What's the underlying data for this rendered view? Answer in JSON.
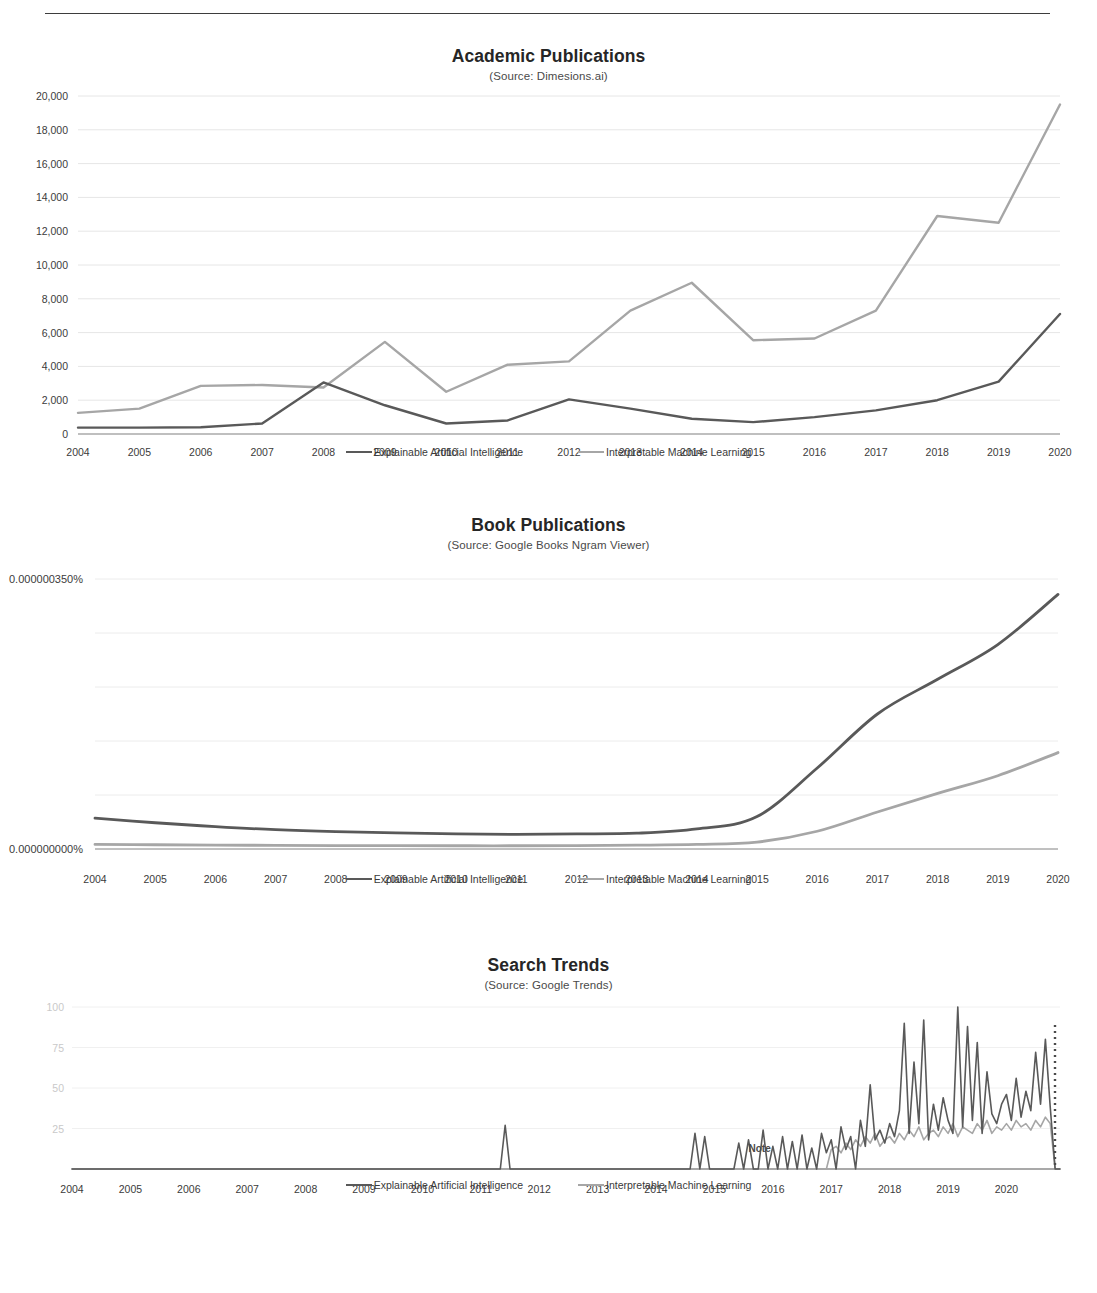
{
  "header": {
    "running_text": "",
    "rule": "horizontal-rule"
  },
  "series_names": {
    "xai": "Explainable Artificial Intelligence",
    "iml": "Interpretable Machine Learning"
  },
  "colors": {
    "xai": "#595959",
    "iml": "#a6a6a6",
    "grid": "#e6e6e6",
    "axis": "#8c8c8c",
    "text": "#3b3b3b",
    "faint_text": "#c9c9c9"
  },
  "charts": [
    {
      "id": "academic-publications",
      "title": "Academic Publications",
      "subtitle": "(Source: Dimesions.ai)",
      "legend": {
        "xai": "Explainable Artificial Intelligence",
        "iml": "Interpretable Machine Learning"
      }
    },
    {
      "id": "book-publications",
      "title": "Book Publications",
      "subtitle": "(Source: Google Books  Ngram Viewer)",
      "legend": {
        "xai": "Explainable Artificial Intelligence",
        "iml": "Interpretable Machine Learning"
      }
    },
    {
      "id": "search-trends",
      "title": "Search Trends",
      "subtitle": "(Source: Google Trends)",
      "annotation": "Note",
      "legend": {
        "xai": "Explainable Artificial Intelligence",
        "iml": "Interpretable Machine Learning"
      }
    }
  ],
  "chart_data": [
    {
      "type": "line",
      "id": "academic-publications",
      "title": "Academic Publications",
      "subtitle": "(Source: Dimesions.ai)",
      "xlabel": "",
      "ylabel": "",
      "grid": true,
      "legend_position": "bottom",
      "ylim": [
        0,
        20000
      ],
      "yticks": [
        0,
        2000,
        4000,
        6000,
        8000,
        10000,
        12000,
        14000,
        16000,
        18000,
        20000
      ],
      "ytick_labels": [
        "0",
        "2,000",
        "4,000",
        "6,000",
        "8,000",
        "10,000",
        "12,000",
        "14,000",
        "16,000",
        "18,000",
        "20,000"
      ],
      "categories": [
        2004,
        2005,
        2006,
        2007,
        2008,
        2009,
        2010,
        2011,
        2012,
        2013,
        2014,
        2015,
        2016,
        2017,
        2018,
        2019,
        2020
      ],
      "xtick_labels": [
        "2004",
        "2005",
        "2006",
        "2007",
        "2008",
        "2009",
        "2010",
        "2011",
        "2012",
        "2013",
        "2014",
        "2015",
        "2016",
        "2017",
        "2018",
        "2019",
        "2020"
      ],
      "series": [
        {
          "name": "Explainable Artificial Intelligence",
          "color": "#595959",
          "values": [
            380,
            380,
            400,
            620,
            3050,
            1700,
            620,
            800,
            2050,
            1500,
            900,
            700,
            1000,
            1400,
            2000,
            3100,
            7100
          ]
        },
        {
          "name": "Interpretable Machine Learning",
          "color": "#a6a6a6",
          "values": [
            1250,
            1500,
            2850,
            2900,
            2750,
            5450,
            2500,
            4100,
            4300,
            7300,
            8950,
            5550,
            5650,
            7300,
            12900,
            12500,
            19500
          ]
        }
      ]
    },
    {
      "type": "line",
      "id": "book-publications",
      "title": "Book Publications",
      "subtitle": "(Source: Google Books  Ngram Viewer)",
      "xlabel": "",
      "ylabel": "",
      "grid": true,
      "legend_position": "bottom",
      "ylim": [
        0,
        3.5e-07
      ],
      "yticks": [
        0,
        3.5e-07
      ],
      "ytick_labels": [
        "0.000000000%",
        "0.000000350%"
      ],
      "categories": [
        2004,
        2005,
        2006,
        2007,
        2008,
        2009,
        2010,
        2011,
        2012,
        2013,
        2014,
        2015,
        2016,
        2017,
        2018,
        2019,
        2020
      ],
      "xtick_labels": [
        "2004",
        "2005",
        "2006",
        "2007",
        "2008",
        "2009",
        "2010",
        "2011",
        "2012",
        "2013",
        "2014",
        "2015",
        "2016",
        "2017",
        "2018",
        "2019",
        "2020"
      ],
      "series": [
        {
          "name": "Explainable Artificial Intelligence",
          "color": "#595959",
          "values": [
            4e-08,
            3.4e-08,
            2.9e-08,
            2.5e-08,
            2.25e-08,
            2.1e-08,
            1.95e-08,
            1.9e-08,
            1.95e-08,
            2.05e-08,
            2.6e-08,
            4.2e-08,
            1.05e-07,
            1.75e-07,
            2.2e-07,
            2.65e-07,
            3.3e-07
          ]
        },
        {
          "name": "Interpretable Machine Learning",
          "color": "#a6a6a6",
          "values": [
            6e-09,
            5.5e-09,
            5e-09,
            4.8e-09,
            4.5e-09,
            4.3e-09,
            4.2e-09,
            4.2e-09,
            4.5e-09,
            5e-09,
            6e-09,
            9e-09,
            2.3e-08,
            4.8e-08,
            7.2e-08,
            9.5e-08,
            1.25e-07
          ]
        }
      ]
    },
    {
      "type": "line",
      "id": "search-trends",
      "title": "Search Trends",
      "subtitle": "(Source: Google Trends)",
      "xlabel": "",
      "ylabel": "",
      "grid": true,
      "legend_position": "bottom",
      "annotation": "Note",
      "ylim": [
        0,
        100
      ],
      "yticks": [
        25,
        50,
        75,
        100
      ],
      "ytick_labels": [
        "25",
        "50",
        "75",
        "100"
      ],
      "xtick_labels": [
        "2004",
        "2005",
        "2006",
        "2007",
        "2008",
        "2009",
        "2010",
        "2011",
        "2012",
        "2013",
        "2014",
        "2015",
        "2016",
        "2017",
        "2018",
        "2019",
        "2020"
      ],
      "x_start": 2004,
      "x_end": 2020.75,
      "sampling": "monthly",
      "series": [
        {
          "name": "Explainable Artificial Intelligence",
          "color": "#595959",
          "values": [
            0,
            0,
            0,
            0,
            0,
            0,
            0,
            0,
            0,
            0,
            0,
            0,
            0,
            0,
            0,
            0,
            0,
            0,
            0,
            0,
            0,
            0,
            0,
            0,
            0,
            0,
            0,
            0,
            0,
            0,
            0,
            0,
            0,
            0,
            0,
            0,
            0,
            0,
            0,
            0,
            0,
            0,
            0,
            0,
            0,
            0,
            0,
            0,
            0,
            0,
            0,
            0,
            0,
            0,
            0,
            0,
            0,
            0,
            0,
            0,
            0,
            0,
            0,
            0,
            0,
            0,
            0,
            0,
            0,
            0,
            0,
            0,
            0,
            0,
            0,
            0,
            0,
            0,
            0,
            0,
            0,
            0,
            0,
            0,
            0,
            0,
            0,
            0,
            0,
            27,
            0,
            0,
            0,
            0,
            0,
            0,
            0,
            0,
            0,
            0,
            0,
            0,
            0,
            0,
            0,
            0,
            0,
            0,
            0,
            0,
            0,
            0,
            0,
            0,
            0,
            0,
            0,
            0,
            0,
            0,
            0,
            0,
            0,
            0,
            0,
            0,
            0,
            0,
            22,
            0,
            20,
            0,
            0,
            0,
            0,
            0,
            0,
            16,
            0,
            18,
            0,
            0,
            24,
            0,
            14,
            0,
            20,
            0,
            17,
            0,
            21,
            0,
            13,
            0,
            22,
            10,
            18,
            0,
            26,
            12,
            20,
            0,
            30,
            14,
            52,
            18,
            24,
            16,
            28,
            20,
            36,
            90,
            22,
            66,
            28,
            92,
            18,
            40,
            24,
            44,
            30,
            22,
            100,
            26,
            88,
            30,
            78,
            22,
            60,
            34,
            28,
            40,
            46,
            30,
            56,
            32,
            48,
            36,
            72,
            40,
            80,
            38,
            0,
            0
          ]
        },
        {
          "name": "Interpretable Machine Learning",
          "color": "#a6a6a6",
          "values": [
            0,
            0,
            0,
            0,
            0,
            0,
            0,
            0,
            0,
            0,
            0,
            0,
            0,
            0,
            0,
            0,
            0,
            0,
            0,
            0,
            0,
            0,
            0,
            0,
            0,
            0,
            0,
            0,
            0,
            0,
            0,
            0,
            0,
            0,
            0,
            0,
            0,
            0,
            0,
            0,
            0,
            0,
            0,
            0,
            0,
            0,
            0,
            0,
            0,
            0,
            0,
            0,
            0,
            0,
            0,
            0,
            0,
            0,
            0,
            0,
            0,
            0,
            0,
            0,
            0,
            0,
            0,
            0,
            0,
            0,
            0,
            0,
            0,
            0,
            0,
            0,
            0,
            0,
            0,
            0,
            0,
            0,
            0,
            0,
            0,
            0,
            0,
            0,
            0,
            0,
            0,
            0,
            0,
            0,
            0,
            0,
            0,
            0,
            0,
            0,
            0,
            0,
            0,
            0,
            0,
            0,
            0,
            0,
            0,
            0,
            0,
            0,
            0,
            0,
            0,
            0,
            0,
            0,
            0,
            0,
            0,
            0,
            0,
            0,
            0,
            0,
            0,
            0,
            0,
            0,
            0,
            0,
            0,
            0,
            0,
            0,
            0,
            0,
            0,
            0,
            0,
            0,
            0,
            0,
            0,
            0,
            0,
            0,
            0,
            0,
            0,
            0,
            0,
            0,
            0,
            0,
            12,
            14,
            10,
            16,
            12,
            18,
            14,
            20,
            16,
            22,
            14,
            18,
            20,
            16,
            22,
            18,
            24,
            20,
            26,
            18,
            22,
            24,
            20,
            26,
            22,
            28,
            20,
            26,
            24,
            22,
            28,
            24,
            30,
            22,
            26,
            24,
            28,
            24,
            30,
            26,
            28,
            24,
            30,
            26,
            32,
            28,
            0,
            0
          ]
        }
      ],
      "marker_line": "dotted-vertical-right-edge"
    }
  ]
}
